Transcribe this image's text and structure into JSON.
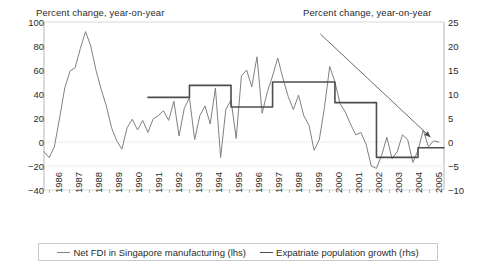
{
  "chart_data": {
    "type": "line",
    "title": "",
    "left_axis": {
      "label": "Percent change, year-on-year",
      "ticks": [
        100,
        80,
        60,
        40,
        20,
        0,
        -20,
        -40
      ],
      "ylim": [
        -40,
        100
      ]
    },
    "right_axis": {
      "label": "Percent change, year-on-year",
      "ticks": [
        25,
        20,
        15,
        10,
        5,
        0,
        -5,
        -10
      ],
      "ylim": [
        -10,
        25
      ]
    },
    "xlabel": "",
    "categories": [
      "1986",
      "1987",
      "1988",
      "1989",
      "1990",
      "1991",
      "1992",
      "1993",
      "1994",
      "1995",
      "1996",
      "1997",
      "1998",
      "1999",
      "2000",
      "2001",
      "2002",
      "2003",
      "2004",
      "2005"
    ],
    "grid": false,
    "legend_position": "bottom",
    "annotations": [
      {
        "name": "downward-trend-arrow",
        "type": "arrow",
        "from_x": 1999.3,
        "from_y_right": 22.5,
        "to_x": 2004.6,
        "to_y_right": 1.0
      }
    ],
    "series": [
      {
        "name": "Net FDI in Singapore manufacturing (lhs)",
        "axis": "left",
        "color": "#808080",
        "width": 1,
        "frequency": "quarterly",
        "x": [
          1986.0,
          1986.25,
          1986.5,
          1986.75,
          1987.0,
          1987.25,
          1987.5,
          1987.75,
          1988.0,
          1988.25,
          1988.5,
          1988.75,
          1989.0,
          1989.25,
          1989.5,
          1989.75,
          1990.0,
          1990.25,
          1990.5,
          1990.75,
          1991.0,
          1991.25,
          1991.5,
          1991.75,
          1992.0,
          1992.25,
          1992.5,
          1992.75,
          1993.0,
          1993.25,
          1993.5,
          1993.75,
          1994.0,
          1994.25,
          1994.5,
          1994.75,
          1995.0,
          1995.25,
          1995.5,
          1995.75,
          1996.0,
          1996.25,
          1996.5,
          1996.75,
          1997.0,
          1997.25,
          1997.5,
          1997.75,
          1998.0,
          1998.25,
          1998.5,
          1998.75,
          1999.0,
          1999.25,
          1999.5,
          1999.75,
          2000.0,
          2000.25,
          2000.5,
          2000.75,
          2001.0,
          2001.25,
          2001.5,
          2001.75,
          2002.0,
          2002.25,
          2002.5,
          2002.75,
          2003.0,
          2003.25,
          2003.5,
          2003.75,
          2004.0,
          2004.25,
          2004.5,
          2004.75,
          2005.0
        ],
        "values": [
          -8,
          -13,
          -4,
          20,
          45,
          59,
          62,
          78,
          92,
          80,
          60,
          44,
          30,
          12,
          1,
          -6,
          12,
          19,
          10,
          18,
          8,
          19,
          22,
          26,
          18,
          34,
          5,
          28,
          37,
          2,
          22,
          30,
          15,
          45,
          -13,
          27,
          35,
          3,
          55,
          60,
          46,
          71,
          24,
          42,
          55,
          70,
          53,
          38,
          27,
          39,
          22,
          14,
          -7,
          2,
          29,
          63,
          50,
          32,
          25,
          15,
          6,
          8,
          -2,
          -20,
          -22,
          -11,
          4,
          -14,
          -8,
          6,
          2,
          -17,
          -7,
          10,
          -4,
          1,
          0
        ]
      },
      {
        "name": "Expatriate population growth (rhs)",
        "axis": "right",
        "color": "#4d4d4d",
        "width": 1.6,
        "frequency": "annual-step",
        "x": [
          1991.0,
          1992.0,
          1993.0,
          1994.0,
          1995.0,
          1996.0,
          1997.0,
          1998.0,
          1999.0,
          2000.0,
          2001.0,
          2002.0,
          2003.0,
          2004.0,
          2005.0
        ],
        "values": [
          9.3,
          9.3,
          11.8,
          11.8,
          7.3,
          7.3,
          12.5,
          12.5,
          12.5,
          8.2,
          8.2,
          -3.2,
          -3.2,
          -1.2,
          -1.2
        ]
      }
    ]
  },
  "legend": {
    "items": [
      {
        "label": "Net FDI in Singapore manufacturing (lhs)",
        "color": "#808080"
      },
      {
        "label": "Expatriate population growth (rhs)",
        "color": "#4d4d4d"
      }
    ]
  }
}
